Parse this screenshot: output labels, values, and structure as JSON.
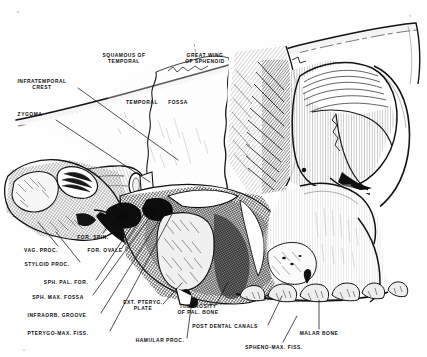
{
  "plate": {
    "title": "Lateral view of skull — infratemporal and pterygomaxillary region",
    "style": "engraving",
    "ink_color": "#111111",
    "paper_color": "#fefefe",
    "width": 427,
    "height": 357
  },
  "labels": [
    {
      "id": "squamous-of-temporal",
      "text": "SQUAMOUS OF\nTEMPORAL",
      "x": 124,
      "y": 59,
      "anchor": "center"
    },
    {
      "id": "great-wing-of-sphenoid",
      "text": "GREAT WING\nOF SPHENOID",
      "x": 205,
      "y": 59,
      "anchor": "center"
    },
    {
      "id": "infratemporal-crest",
      "text": "INFRATEMPORAL\nCREST",
      "x": 42,
      "y": 85,
      "anchor": "center"
    },
    {
      "id": "temporal",
      "text": "TEMPORAL",
      "x": 142,
      "y": 103,
      "anchor": "center"
    },
    {
      "id": "fossa",
      "text": "FOSSA",
      "x": 178,
      "y": 103,
      "anchor": "center"
    },
    {
      "id": "zygoma",
      "text": "ZYGOMA",
      "x": 30,
      "y": 115,
      "anchor": "center"
    },
    {
      "id": "for-spin",
      "text": "FOR. SPIN.",
      "x": 93,
      "y": 238,
      "anchor": "center"
    },
    {
      "id": "for-ovale",
      "text": "FOR. OVALE",
      "x": 105,
      "y": 251,
      "anchor": "center"
    },
    {
      "id": "vag-proc",
      "text": "VAG. PROC.",
      "x": 41,
      "y": 251,
      "anchor": "center"
    },
    {
      "id": "styloid-proc",
      "text": "STYLOID PROC.",
      "x": 47,
      "y": 265,
      "anchor": "center"
    },
    {
      "id": "sph-pal-for",
      "text": "SPH. PAL. FOR.",
      "x": 66,
      "y": 283,
      "anchor": "center"
    },
    {
      "id": "sph-max-fossa",
      "text": "SPH. MAX. FOSSA",
      "x": 58,
      "y": 298,
      "anchor": "center"
    },
    {
      "id": "infraorb-groove",
      "text": "INFRAORB. GROOVE",
      "x": 57,
      "y": 316,
      "anchor": "center"
    },
    {
      "id": "pterygo-max-fiss",
      "text": "PTERYGO-MAX. FISS.",
      "x": 58,
      "y": 334,
      "anchor": "center"
    },
    {
      "id": "ext-pteryg-plate",
      "text": "EXT. PTERYG.\nPLATE",
      "x": 143,
      "y": 306,
      "anchor": "center"
    },
    {
      "id": "tuberosity-of-pal-bone",
      "text": "TUBEROSITY\nOF PAL. BONE",
      "x": 198,
      "y": 310,
      "anchor": "center"
    },
    {
      "id": "post-dental-canals",
      "text": "POST DENTAL CANALS",
      "x": 225,
      "y": 327,
      "anchor": "center"
    },
    {
      "id": "hamular-proc",
      "text": "HAMULAR PROC.",
      "x": 160,
      "y": 341,
      "anchor": "center"
    },
    {
      "id": "malar-bone",
      "text": "MALAR BONE",
      "x": 319,
      "y": 334,
      "anchor": "center"
    },
    {
      "id": "spheno-max-fiss",
      "text": "SPHENO-MAX. FISS.",
      "x": 274,
      "y": 348,
      "anchor": "center"
    }
  ],
  "leaders": [
    {
      "id": "leader-infratemporal-crest",
      "from": [
        78,
        88
      ],
      "to": [
        178,
        160
      ]
    },
    {
      "id": "leader-zygoma",
      "from": [
        56,
        120
      ],
      "to": [
        150,
        182
      ]
    },
    {
      "id": "leader-vag-proc",
      "from": [
        58,
        246
      ],
      "to": [
        38,
        222
      ]
    },
    {
      "id": "leader-styloid-proc",
      "from": [
        80,
        262
      ],
      "to": [
        56,
        232
      ]
    },
    {
      "id": "leader-for-spin",
      "from": [
        103,
        233
      ],
      "to": [
        118,
        212
      ]
    },
    {
      "id": "leader-for-ovale",
      "from": [
        122,
        248
      ],
      "to": [
        150,
        205
      ]
    },
    {
      "id": "leader-sph-pal-for",
      "from": [
        96,
        280
      ],
      "to": [
        140,
        214
      ]
    },
    {
      "id": "leader-sph-max-fossa",
      "from": [
        93,
        295
      ],
      "to": [
        152,
        214
      ]
    },
    {
      "id": "leader-infraorb-groove",
      "from": [
        101,
        313
      ],
      "to": [
        163,
        214
      ]
    },
    {
      "id": "leader-pterygo-max-fiss",
      "from": [
        110,
        331
      ],
      "to": [
        172,
        214
      ]
    },
    {
      "id": "leader-ext-pteryg-plate",
      "from": [
        163,
        304
      ],
      "to": [
        182,
        283
      ]
    },
    {
      "id": "leader-hamular-proc",
      "from": [
        187,
        338
      ],
      "to": [
        192,
        300
      ]
    },
    {
      "id": "leader-tuberosity",
      "from": [
        216,
        305
      ],
      "to": [
        228,
        282
      ]
    },
    {
      "id": "leader-post-dental-canals",
      "from": [
        268,
        325
      ],
      "to": [
        282,
        296
      ]
    },
    {
      "id": "leader-malar-bone",
      "from": [
        319,
        329
      ],
      "to": [
        319,
        300
      ]
    },
    {
      "id": "leader-spheno-max-fiss",
      "from": [
        283,
        342
      ],
      "to": [
        297,
        316
      ]
    }
  ]
}
